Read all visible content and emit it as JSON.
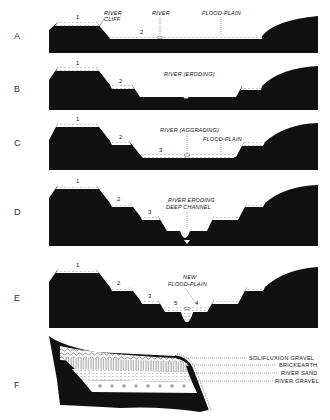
{
  "figure": {
    "panels": [
      {
        "letter": "A",
        "labels": {
          "river_cliff_1": "RIVER",
          "river_cliff_2": "CLIFF",
          "river": "RIVER",
          "flood_plain": "FLOOD-PLAIN",
          "t1": "1",
          "t2": "2"
        }
      },
      {
        "letter": "B",
        "labels": {
          "river": "RIVER (ERODING)",
          "t1": "1",
          "t2": "2"
        }
      },
      {
        "letter": "C",
        "labels": {
          "river": "RIVER (AGGRADING)",
          "flood_plain": "FLOOD-PLAIN",
          "t1": "1",
          "t2": "2",
          "t3": "3"
        }
      },
      {
        "letter": "D",
        "labels": {
          "river_1": "RIVER ERODING",
          "river_2": "DEEP CHANNEL",
          "t1": "1",
          "t2": "2",
          "t3": "3"
        }
      },
      {
        "letter": "E",
        "labels": {
          "new_1": "NEW",
          "new_2": "FLOOD-PLAIN",
          "t1": "1",
          "t2": "2",
          "t3": "3",
          "t4": "4",
          "t5": "5"
        }
      },
      {
        "letter": "F",
        "legend": [
          "SOLIFLUXION GRAVEL",
          "BRICKEARTH",
          "RIVER SAND",
          "RIVER GRAVEL"
        ]
      }
    ]
  },
  "colors": {
    "rock": "#111111",
    "deposit": "#ffffff"
  }
}
